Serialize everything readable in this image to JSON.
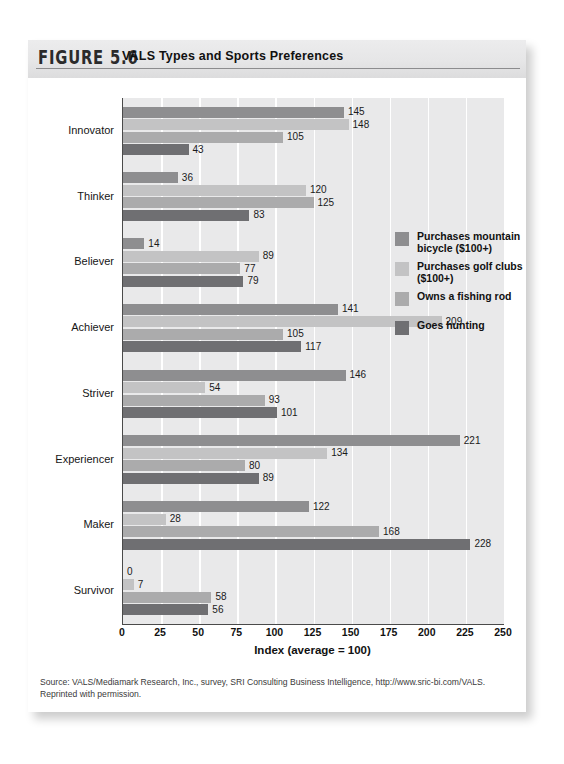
{
  "figure": {
    "number": "FIGURE 5.6",
    "title": "VALS Types and Sports Preferences"
  },
  "source_note": "Source: VALS/Mediamark Research, Inc., survey, SRI Consulting Business Intelligence, http://www.sric-bi.com/VALS. Reprinted with permission.",
  "chart_data": {
    "type": "bar",
    "orientation": "horizontal",
    "title": "VALS Types and Sports Preferences",
    "xlabel": "Index (average = 100)",
    "ylabel": "",
    "xlim": [
      0,
      250
    ],
    "xticks": [
      0,
      25,
      50,
      75,
      100,
      125,
      150,
      175,
      200,
      225,
      250
    ],
    "grid": true,
    "legend_position": "inside-right",
    "categories": [
      "Innovator",
      "Thinker",
      "Believer",
      "Achiever",
      "Striver",
      "Experiencer",
      "Maker",
      "Survivor"
    ],
    "series": [
      {
        "name": "Purchases mountain bicycle ($100+)",
        "color": "#8e8e90",
        "values": [
          145,
          36,
          14,
          141,
          146,
          221,
          122,
          0
        ]
      },
      {
        "name": "Purchases golf clubs ($100+)",
        "color": "#c3c3c4",
        "values": [
          148,
          120,
          89,
          209,
          54,
          134,
          28,
          7
        ]
      },
      {
        "name": "Owns a fishing rod",
        "color": "#ababac",
        "values": [
          105,
          125,
          77,
          105,
          93,
          80,
          168,
          58
        ]
      },
      {
        "name": "Goes hunting",
        "color": "#6f6f72",
        "values": [
          43,
          83,
          79,
          117,
          101,
          89,
          228,
          56
        ]
      }
    ]
  }
}
